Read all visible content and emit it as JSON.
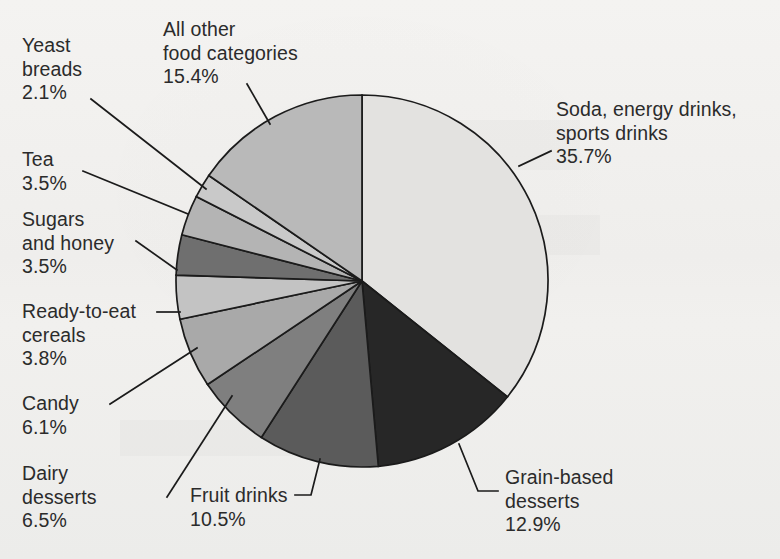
{
  "figure": {
    "background_color": "#f1f0ee",
    "outline_color": "#1b1b1b"
  },
  "chart_data": {
    "type": "pie",
    "title": "",
    "subtitle": "",
    "xlabel": "",
    "ylabel": "",
    "legend_position": "callout-labels",
    "grid": false,
    "units": "percent",
    "total": 100.0,
    "start_angle_deg": 0,
    "direction": "clockwise",
    "categories": [
      "Soda, energy drinks, sports drinks",
      "Grain-based desserts",
      "Fruit drinks",
      "Dairy desserts",
      "Candy",
      "Ready-to-eat cereals",
      "Sugars and honey",
      "Tea",
      "Yeast breads",
      "All other food categories"
    ],
    "values": [
      35.7,
      12.9,
      10.5,
      6.5,
      6.1,
      3.8,
      3.5,
      3.5,
      2.1,
      15.4
    ],
    "slice_colors": [
      "#e3e2e0",
      "#272727",
      "#5b5b5b",
      "#7f7f7f",
      "#a9a9a9",
      "#c3c3c3",
      "#6f6f6f",
      "#b4b4b4",
      "#c9c9c9",
      "#b9b9b9"
    ],
    "slices": [
      {
        "label": "Soda, energy drinks, sports drinks",
        "value": 35.7,
        "value_text": "35.7%",
        "color": "#e3e2e0"
      },
      {
        "label": "Grain-based desserts",
        "value": 12.9,
        "value_text": "12.9%",
        "color": "#272727"
      },
      {
        "label": "Fruit drinks",
        "value": 10.5,
        "value_text": "10.5%",
        "color": "#5b5b5b"
      },
      {
        "label": "Dairy desserts",
        "value": 6.5,
        "value_text": "6.5%",
        "color": "#7f7f7f"
      },
      {
        "label": "Candy",
        "value": 6.1,
        "value_text": "6.1%",
        "color": "#a9a9a9"
      },
      {
        "label": "Ready-to-eat cereals",
        "value": 3.8,
        "value_text": "3.8%",
        "color": "#c3c3c3"
      },
      {
        "label": "Sugars and honey",
        "value": 3.5,
        "value_text": "3.5%",
        "color": "#6f6f6f"
      },
      {
        "label": "Tea",
        "value": 3.5,
        "value_text": "3.5%",
        "color": "#b4b4b4"
      },
      {
        "label": "Yeast breads",
        "value": 2.1,
        "value_text": "2.1%",
        "color": "#c9c9c9"
      },
      {
        "label": "All other food categories",
        "value": 15.4,
        "value_text": "15.4%",
        "color": "#b9b9b9"
      }
    ]
  },
  "labels": {
    "yeast_breads": "Yeast\nbreads\n2.1%",
    "all_other": "All other\nfood categories\n15.4%",
    "tea": "Tea\n3.5%",
    "sugars_and_honey": "Sugars\nand honey\n3.5%",
    "ready_to_eat_cereals": "Ready-to-eat\ncereals\n3.8%",
    "candy": "Candy\n6.1%",
    "dairy_desserts": "Dairy\ndesserts\n6.5%",
    "fruit_drinks": "Fruit drinks\n10.5%",
    "grain_based_desserts": "Grain-based\ndesserts\n12.9%",
    "soda": "Soda, energy drinks,\nsports drinks\n35.7%"
  }
}
